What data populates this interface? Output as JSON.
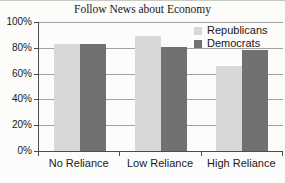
{
  "chart_data": {
    "type": "bar",
    "title": "Follow News about Economy",
    "categories": [
      "No Reliance",
      "Low Reliance",
      "High Reliance"
    ],
    "series": [
      {
        "name": "Republicans",
        "color": "#d8d8d8",
        "values": [
          83,
          89,
          66
        ]
      },
      {
        "name": "Democrats",
        "color": "#717171",
        "values": [
          83,
          81,
          78
        ]
      }
    ],
    "ylabel": "",
    "xlabel": "",
    "ylim": [
      0,
      100
    ],
    "y_tick_step": 20,
    "y_tick_labels": [
      "0%",
      "20%",
      "40%",
      "60%",
      "80%",
      "100%"
    ],
    "grid": "horizontal",
    "legend_position": "top-right-inside"
  }
}
